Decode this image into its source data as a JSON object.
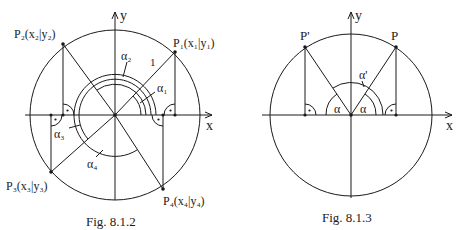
{
  "figures": [
    {
      "id": "fig-8-1-2",
      "caption": "Fig. 8.1.2",
      "axes": {
        "x_label": "x",
        "y_label": "y"
      },
      "radius_label": "1",
      "points": [
        {
          "name": "P1",
          "label": "P₁(x₁|y₁)"
        },
        {
          "name": "P2",
          "label": "P₂(x₂|y₂)"
        },
        {
          "name": "P3",
          "label": "P₃(x₃|y₃)"
        },
        {
          "name": "P4",
          "label": "P₄(x₄|y₄)"
        }
      ],
      "angles": [
        {
          "name": "alpha1",
          "label": "α₁"
        },
        {
          "name": "alpha2",
          "label": "α₂"
        },
        {
          "name": "alpha3",
          "label": "α₃"
        },
        {
          "name": "alpha4",
          "label": "α₄"
        }
      ]
    },
    {
      "id": "fig-8-1-3",
      "caption": "Fig. 8.1.3",
      "axes": {
        "x_label": "x",
        "y_label": "y"
      },
      "points": [
        {
          "name": "P",
          "label": "P"
        },
        {
          "name": "P-prime",
          "label": "P'"
        }
      ],
      "angles": [
        {
          "name": "alpha-left",
          "label": "α"
        },
        {
          "name": "alpha-right",
          "label": "α"
        },
        {
          "name": "alpha-prime",
          "label": "α'"
        }
      ]
    }
  ]
}
